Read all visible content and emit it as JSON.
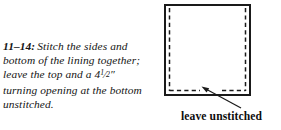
{
  "figure": {
    "number": "11–14:",
    "caption_text": "Stitch the sides and bottom of the lining together; leave the top and a 4½″ turning opening at the bottom unstitched.",
    "caption_segment_1": "Stitch the sides and bottom of the lining together; leave the top and a ",
    "measurement": {
      "whole": "4",
      "numerator": "1",
      "slash": "⁄",
      "denominator": "2",
      "unit": "″"
    },
    "caption_segment_2": " turning opening at the bottom unstitched."
  },
  "diagram": {
    "name": "lining-rectangle-diagram",
    "outline_label": "lining fabric outline",
    "stitch_line_label": "stitching line",
    "opening_label": "turning opening gap",
    "colors": {
      "outline": "#1a1a1a",
      "stitch": "#1a1a1a",
      "arrow": "#1a1a1a",
      "background": "#ffffff"
    },
    "rect": {
      "x": 10,
      "y": 5,
      "width": 85,
      "height": 90
    },
    "stitch_inset": 4,
    "opening": {
      "start_x": 45,
      "end_x": 67
    },
    "arrow": {
      "tip_x": 47,
      "tip_y": 87,
      "tail_x": 86,
      "tail_y": 108
    }
  },
  "annotation": {
    "label": "leave unstitched"
  }
}
